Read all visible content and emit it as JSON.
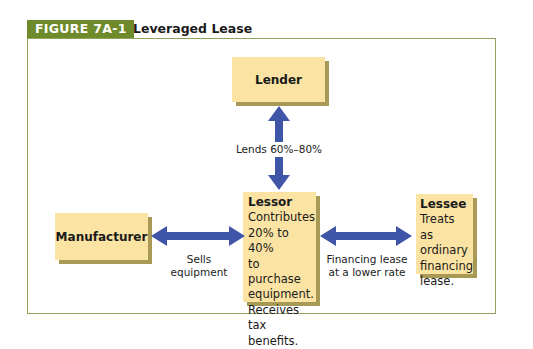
{
  "figure": {
    "tag": "FIGURE 7A-1",
    "title": "Leveraged Lease"
  },
  "colors": {
    "tag_bg": "#6e8a2b",
    "frame_border": "#8fa35a",
    "box_fill": "#fbe3a3",
    "box_shadow": "#a89a55",
    "arrow": "#3f56a8"
  },
  "nodes": {
    "lender": {
      "title": "Lender"
    },
    "lessor": {
      "title": "Lessor",
      "lines": [
        "Contributes",
        "20% to 40%",
        "to purchase",
        "equipment.",
        "Receives tax",
        "benefits."
      ]
    },
    "manufacturer": {
      "title": "Manufacturer"
    },
    "lessee": {
      "title": "Lessee",
      "lines": [
        "Treats as",
        "ordinary",
        "financing",
        "lease."
      ]
    }
  },
  "edges": {
    "lender_lessor": {
      "label": "Lends 60%–80%",
      "direction": "bidirectional-vertical"
    },
    "manufacturer_lessor": {
      "label_line1": "Sells",
      "label_line2": "equipment",
      "direction": "bidirectional"
    },
    "lessor_lessee": {
      "label_line1": "Financing lease",
      "label_line2": "at a lower rate",
      "direction": "bidirectional"
    }
  }
}
